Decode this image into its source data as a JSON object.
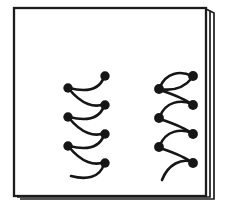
{
  "figure": {
    "kind": "line-drawing",
    "canvas": {
      "width": 244,
      "height": 212
    },
    "colors": {
      "ink": "#161616",
      "frame": "#1c1c1c",
      "paper": "#ffffff",
      "background": "#ffffff"
    },
    "frame": {
      "name": "page-card",
      "description": "Rectangular card with a doubled right edge suggesting page thickness",
      "inner_rect": {
        "x": 14,
        "y": 8,
        "width": 196,
        "height": 188
      },
      "outer_rect": {
        "x": 18,
        "y": 11,
        "width": 196,
        "height": 188
      },
      "stroke_width": 2.2,
      "depth_edges": 2
    },
    "groups": [
      {
        "name": "left-arc-chain",
        "label": "Left group: sagging arcs",
        "arc_direction": "concave-up",
        "stroke_width": 2.6,
        "dot_radius": 4.6,
        "left_column_x": 68,
        "right_column_x": 105,
        "left_dots_y": [
          88,
          117,
          146
        ],
        "right_dots_y": [
          76,
          105,
          134,
          163
        ],
        "dot_count": 7,
        "arc_count": 7,
        "open_tail": true,
        "open_tail_end": {
          "x": 72,
          "y": 178
        }
      },
      {
        "name": "right-arc-chain",
        "label": "Right group: bulging arcs",
        "arc_direction": "convex-up",
        "stroke_width": 2.6,
        "dot_radius": 4.8,
        "left_column_x": 159,
        "right_column_x": 193,
        "left_dots_y": [
          89,
          118,
          147
        ],
        "right_dots_y": [
          76,
          105,
          134,
          163
        ],
        "dot_count": 7,
        "arc_count": 7,
        "open_tail": true,
        "open_tail_end": {
          "x": 161,
          "y": 180
        }
      }
    ],
    "arcs": {
      "left_group": [
        {
          "name": "left-arc-1",
          "from": [
            105,
            76
          ],
          "to": [
            68,
            88
          ],
          "bow": "down",
          "has_start_dot": true,
          "has_end_dot": true
        },
        {
          "name": "left-arc-2",
          "from": [
            68,
            88
          ],
          "to": [
            105,
            105
          ],
          "bow": "down",
          "has_start_dot": true,
          "has_end_dot": true
        },
        {
          "name": "left-arc-3",
          "from": [
            105,
            105
          ],
          "to": [
            68,
            117
          ],
          "bow": "down",
          "has_start_dot": true,
          "has_end_dot": true
        },
        {
          "name": "left-arc-4",
          "from": [
            68,
            117
          ],
          "to": [
            105,
            134
          ],
          "bow": "down",
          "has_start_dot": true,
          "has_end_dot": true
        },
        {
          "name": "left-arc-5",
          "from": [
            105,
            134
          ],
          "to": [
            68,
            146
          ],
          "bow": "down",
          "has_start_dot": true,
          "has_end_dot": true
        },
        {
          "name": "left-arc-6",
          "from": [
            68,
            146
          ],
          "to": [
            105,
            163
          ],
          "bow": "down",
          "has_start_dot": true,
          "has_end_dot": true
        },
        {
          "name": "left-arc-7",
          "from": [
            105,
            163
          ],
          "to": [
            72,
            178
          ],
          "bow": "down",
          "has_start_dot": true,
          "has_end_dot": false
        }
      ],
      "right_group": [
        {
          "name": "right-arc-1",
          "from": [
            159,
            89
          ],
          "to": [
            193,
            76
          ],
          "bow": "up",
          "has_start_dot": true,
          "has_end_dot": true
        },
        {
          "name": "right-arc-2",
          "from": [
            193,
            76
          ],
          "to": [
            159,
            89
          ],
          "bow": "down",
          "has_start_dot": true,
          "has_end_dot": true
        },
        {
          "name": "right-arc-3",
          "from": [
            159,
            89
          ],
          "to": [
            193,
            105
          ],
          "bow": "up",
          "has_start_dot": true,
          "has_end_dot": true
        },
        {
          "name": "right-arc-4",
          "from": [
            159,
            118
          ],
          "to": [
            193,
            105
          ],
          "bow": "up",
          "has_start_dot": true,
          "has_end_dot": true
        },
        {
          "name": "right-arc-5",
          "from": [
            159,
            118
          ],
          "to": [
            193,
            134
          ],
          "bow": "up",
          "has_start_dot": true,
          "has_end_dot": true
        },
        {
          "name": "right-arc-6",
          "from": [
            159,
            147
          ],
          "to": [
            193,
            134
          ],
          "bow": "up",
          "has_start_dot": true,
          "has_end_dot": true
        },
        {
          "name": "right-arc-7",
          "from": [
            159,
            147
          ],
          "to": [
            193,
            163
          ],
          "bow": "up",
          "has_start_dot": true,
          "has_end_dot": true
        },
        {
          "name": "right-arc-8",
          "from": [
            161,
            180
          ],
          "to": [
            193,
            163
          ],
          "bow": "up",
          "has_start_dot": false,
          "has_end_dot": true
        }
      ]
    },
    "text_labels": []
  }
}
